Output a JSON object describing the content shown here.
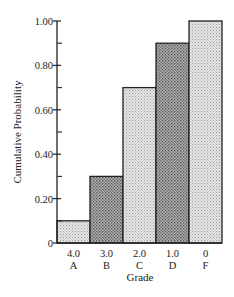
{
  "chart_data": {
    "type": "bar",
    "title": "",
    "xlabel": "Grade",
    "ylabel": "Cumulative Probability",
    "categories": [
      "A",
      "B",
      "C",
      "D",
      "F"
    ],
    "category_values": [
      "4.0",
      "3.0",
      "2.0",
      "1.0",
      "0"
    ],
    "values": [
      0.1,
      0.3,
      0.7,
      0.9,
      1.0
    ],
    "ylim": [
      0,
      1.0
    ],
    "yticks": [
      "0",
      "0.20",
      "0.40",
      "0.60",
      "0.80",
      "1.00"
    ],
    "ytick_values": [
      0,
      0.2,
      0.4,
      0.6,
      0.8,
      1.0
    ],
    "grid": false,
    "legend": null,
    "bar_fills": [
      "#d6d6d6",
      "#9a9a9a",
      "#d6d6d6",
      "#9a9a9a",
      "#d6d6d6"
    ]
  }
}
